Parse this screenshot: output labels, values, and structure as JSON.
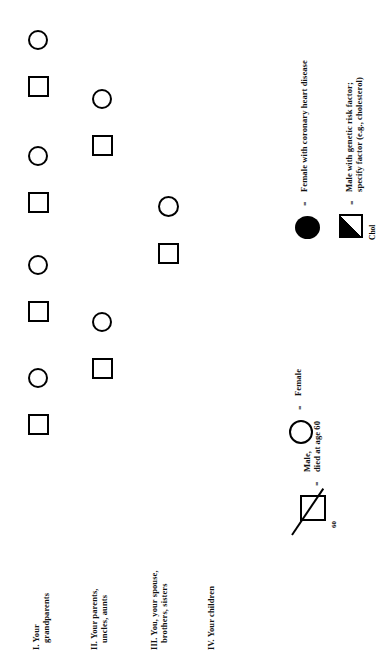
{
  "document": {
    "type": "family-health-pedigree",
    "orientation": "rotated-90-ccw"
  },
  "generations": [
    {
      "id": "gen-1",
      "numeral": "I.",
      "line1": "I. Your",
      "line2": "grandparents"
    },
    {
      "id": "gen-2",
      "numeral": "II.",
      "line1": "II. Your parents,",
      "line2": "uncles, aunts"
    },
    {
      "id": "gen-3",
      "numeral": "III.",
      "line1": "III. You, your spouse,",
      "line2": "brothers, sisters"
    },
    {
      "id": "gen-4",
      "numeral": "IV.",
      "line1": "IV. Your children",
      "line2": ""
    }
  ],
  "legend": {
    "equals": "=",
    "items": [
      {
        "id": "legend-female",
        "symbol": "open-circle",
        "equals": "=",
        "line1": "Female",
        "line2": ""
      },
      {
        "id": "legend-male-deceased",
        "symbol": "slashed-square",
        "equals": "=",
        "line1": "Male,",
        "line2": "died at age 60",
        "age_marker": "60"
      },
      {
        "id": "legend-female-chd",
        "symbol": "filled-circle",
        "equals": "=",
        "line1": "Female with coronary heart disease",
        "line2": ""
      },
      {
        "id": "legend-male-risk-factor",
        "symbol": "half-filled-square",
        "equals": "=",
        "line1": "Male with genetic risk factor;",
        "line2": "specify factor (e.g., cholesterol)",
        "annotation": "Chol"
      }
    ]
  },
  "colors": {
    "ink": "#000000",
    "paper": "#ffffff"
  },
  "pedigree": {
    "individuals": [
      {
        "id": "p1",
        "shape": "circle",
        "generation": "I",
        "role": "grandmother"
      },
      {
        "id": "p2",
        "shape": "square",
        "generation": "I",
        "role": "grandfather"
      },
      {
        "id": "p3",
        "shape": "circle",
        "generation": "I",
        "role": "grandmother"
      },
      {
        "id": "p4",
        "shape": "square",
        "generation": "I",
        "role": "grandfather"
      },
      {
        "id": "p5",
        "shape": "circle",
        "generation": "I",
        "role": "grandmother"
      },
      {
        "id": "p6",
        "shape": "square",
        "generation": "I",
        "role": "grandfather"
      },
      {
        "id": "p7",
        "shape": "circle",
        "generation": "I",
        "role": "grandmother"
      },
      {
        "id": "p8",
        "shape": "square",
        "generation": "I",
        "role": "grandfather"
      },
      {
        "id": "p9",
        "shape": "circle",
        "generation": "II",
        "role": "mother"
      },
      {
        "id": "p10",
        "shape": "square",
        "generation": "II",
        "role": "father"
      },
      {
        "id": "p11",
        "shape": "circle",
        "generation": "II",
        "role": "mother"
      },
      {
        "id": "p12",
        "shape": "square",
        "generation": "II",
        "role": "father"
      },
      {
        "id": "p13",
        "shape": "circle",
        "generation": "III",
        "role": "spouse"
      },
      {
        "id": "p14",
        "shape": "square",
        "generation": "III",
        "role": "self"
      }
    ]
  }
}
